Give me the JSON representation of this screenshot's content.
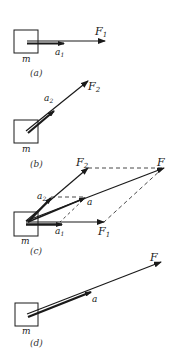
{
  "diagram": {
    "colors": {
      "ink": "#1a1a1a",
      "dash": "#333333",
      "background": "#ffffff"
    },
    "panels": [
      {
        "caption": "(a)",
        "mass_label": "m",
        "force_label": "F",
        "force_sub": "1",
        "accel_label": "a",
        "accel_sub": "1"
      },
      {
        "caption": "(b)",
        "mass_label": "m",
        "force_label": "F",
        "force_sub": "2",
        "accel_label": "a",
        "accel_sub": "2"
      },
      {
        "caption": "(c)",
        "mass_label": "m",
        "f1_label": "F",
        "f1_sub": "1",
        "f2_label": "F",
        "f2_sub": "2",
        "f_label": "F",
        "a_label": "a",
        "a1_label": "a",
        "a1_sub": "1",
        "a2_label": "a",
        "a2_sub": "2"
      },
      {
        "caption": "(d)",
        "mass_label": "m",
        "force_label": "F",
        "accel_label": "a"
      }
    ]
  }
}
